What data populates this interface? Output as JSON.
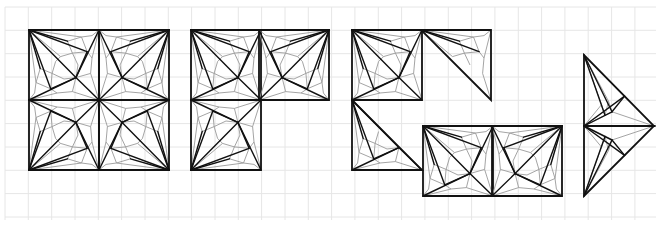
{
  "figure": {
    "width": 660,
    "height": 226,
    "background": "#ffffff",
    "grid": {
      "color": "#e6e6e6",
      "spacing": 23.33,
      "x_start": 5,
      "y_start": 7,
      "x_end": 656,
      "y_end": 220
    },
    "colors": {
      "primary_lines": "#111111",
      "secondary_lines": "#9a9a9a"
    },
    "tile_size": 70,
    "groups": [
      {
        "name": "two-by-two-square",
        "tiles": [
          {
            "type": "square",
            "x": 29,
            "y": 30,
            "fan_corner": "tl"
          },
          {
            "type": "square",
            "x": 99,
            "y": 30,
            "fan_corner": "tr"
          },
          {
            "type": "square",
            "x": 29,
            "y": 100,
            "fan_corner": "bl"
          },
          {
            "type": "square",
            "x": 99,
            "y": 100,
            "fan_corner": "br"
          }
        ]
      },
      {
        "name": "l-shape",
        "tiles": [
          {
            "type": "square",
            "x": 191,
            "y": 30,
            "fan_corner": "tl"
          },
          {
            "type": "square",
            "x": 259,
            "y": 30,
            "fan_corner": "tr"
          },
          {
            "type": "square",
            "x": 191,
            "y": 100,
            "fan_corner": "bl"
          }
        ]
      },
      {
        "name": "staircase-triangle",
        "tiles": [
          {
            "type": "square",
            "x": 352,
            "y": 30,
            "fan_corner": "tl"
          },
          {
            "type": "half",
            "x": 421,
            "y": 30,
            "fan_corner": "tl",
            "cut": "upper"
          },
          {
            "type": "half",
            "x": 352,
            "y": 100,
            "fan_corner": "tl",
            "cut": "left"
          }
        ]
      },
      {
        "name": "domino",
        "tiles": [
          {
            "type": "square",
            "x": 423,
            "y": 126,
            "fan_corner": "tl"
          },
          {
            "type": "square",
            "x": 492,
            "y": 126,
            "fan_corner": "tr"
          }
        ]
      },
      {
        "name": "arrow-triangle",
        "tiles": [
          {
            "type": "tri",
            "points": [
              [
                584,
                55
              ],
              [
                584,
                126
              ],
              [
                654,
                126
              ]
            ],
            "fan": 0
          },
          {
            "type": "tri",
            "points": [
              [
                584,
                196
              ],
              [
                584,
                126
              ],
              [
                654,
                126
              ]
            ],
            "fan": 0
          }
        ]
      }
    ]
  }
}
